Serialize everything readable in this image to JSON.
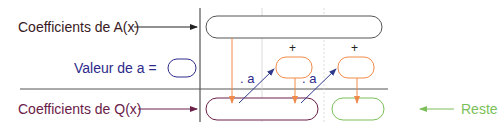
{
  "labels": {
    "coef_a": "Coefficients de A(x)",
    "valeur_a": "Valeur de a =",
    "coef_q": "Coefficients de Q(x)",
    "reste": "Reste",
    "dot_a_1": ". a",
    "dot_a_2": ". a",
    "plus_1": "+",
    "plus_2": "+"
  },
  "colors": {
    "coef_a": "#3a1a1e",
    "valeur": "#2e2a8a",
    "coef_q": "#6a2048",
    "orange": "#f08a4b",
    "blue_arrow": "#2f3a8a",
    "reste": "#7cbf5a",
    "grid": "#333333"
  }
}
